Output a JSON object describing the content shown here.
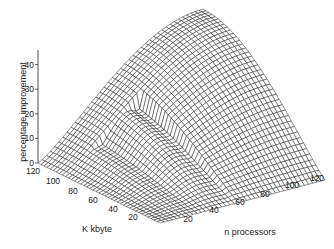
{
  "chart_data": {
    "type": "surface3d",
    "title": "",
    "zlabel": "percentage improvement",
    "xlabel": "n processors",
    "ylabel": "K kbyte",
    "x_ticks": [
      "20",
      "40",
      "60",
      "80",
      "100",
      "120"
    ],
    "y_ticks": [
      "120",
      "100",
      "80",
      "60",
      "40",
      "20"
    ],
    "z_ticks": [
      "0",
      "10",
      "20",
      "30",
      "40"
    ],
    "xlim": [
      0,
      128
    ],
    "ylim": [
      0,
      128
    ],
    "zlim": [
      0,
      45
    ],
    "peak": {
      "n_processors": 128,
      "k_kbyte": 128,
      "percentage_improvement": 45
    },
    "grid": false,
    "style": {
      "line_color": "#111111",
      "face_color": "#ffffff"
    }
  },
  "axes_labels": {
    "z": "percentage improvement",
    "y": "K kbyte",
    "x": "n processors"
  }
}
